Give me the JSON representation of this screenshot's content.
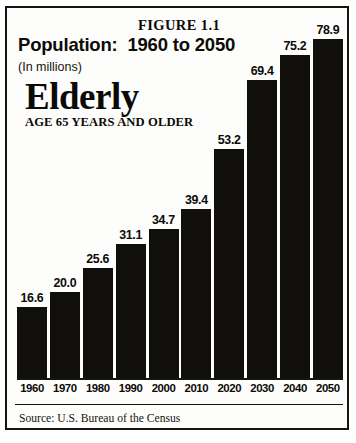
{
  "figure": {
    "label": "FIGURE 1.1",
    "title": "Population:  1960 to 2050",
    "subtitle": "(In millions)",
    "brand_word": "Elderly",
    "brand_subtitle": "AGE 65 YEARS AND OLDER",
    "source": "Source: U.S. Bureau of the Census"
  },
  "colors": {
    "bar": "#100f0c",
    "ink": "#0c0b08",
    "paper": "#fdfdfb",
    "border": "#15140f"
  },
  "chart_data": {
    "type": "bar",
    "subtitle": "(In millions)",
    "xlabel": "",
    "ylabel": "",
    "ylim": [
      0,
      78.9
    ],
    "grid": false,
    "legend": false,
    "categories": [
      "1960",
      "1970",
      "1980",
      "1990",
      "2000",
      "2010",
      "2020",
      "2030",
      "2040",
      "2050"
    ],
    "values": [
      16.6,
      20.0,
      25.6,
      31.1,
      34.7,
      39.4,
      53.2,
      69.4,
      75.2,
      78.9
    ],
    "value_labels": [
      "16.6",
      "20.0",
      "25.6",
      "31.1",
      "34.7",
      "39.4",
      "53.2",
      "69.4",
      "75.2",
      "78.9"
    ],
    "annotations": [
      "FIGURE 1.1",
      "Source: U.S. Bureau of the Census"
    ]
  }
}
